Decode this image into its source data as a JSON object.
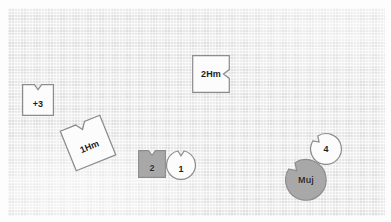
{
  "canvas": {
    "width": 391,
    "height": 222,
    "background_color": "#ececec",
    "frame_color": "#fdfdfd",
    "texture": "fabric-grid"
  },
  "palette": {
    "shape_white_fill": "#fcfcfc",
    "shape_gray_fill": "#a8a8a8",
    "shape_gray_fill_dark": "#9a9a9a",
    "shape_outline": "#8c8c8c",
    "label_color": "#1d1d1d"
  },
  "shapes": [
    {
      "id": "shape-plus3",
      "label": "+3",
      "form": "notched-square",
      "fill": "white",
      "rotation_deg": 0,
      "x": 22,
      "y": 84,
      "size": 32
    },
    {
      "id": "shape-1hm",
      "label": "1Hm",
      "form": "notched-square",
      "fill": "white",
      "rotation_deg": -22,
      "x": 66,
      "y": 121,
      "size": 44
    },
    {
      "id": "shape-2hm",
      "label": "2Hm",
      "form": "notched-square",
      "fill": "white",
      "rotation_deg": 90,
      "x": 192,
      "y": 55,
      "size": 38
    },
    {
      "id": "shape-2",
      "label": "2",
      "form": "notched-square",
      "fill": "gray",
      "rotation_deg": 0,
      "x": 138,
      "y": 150,
      "size": 28
    },
    {
      "id": "shape-1",
      "label": "1",
      "form": "notched-circle",
      "fill": "white",
      "rotation_deg": 0,
      "x": 166,
      "y": 150,
      "size": 30
    },
    {
      "id": "shape-4",
      "label": "4",
      "form": "notched-circle",
      "fill": "white",
      "rotation_deg": -45,
      "x": 310,
      "y": 133,
      "size": 32
    },
    {
      "id": "shape-muj",
      "label": "Muj",
      "form": "notched-circle",
      "fill": "gray",
      "rotation_deg": -45,
      "x": 285,
      "y": 159,
      "size": 42
    }
  ]
}
